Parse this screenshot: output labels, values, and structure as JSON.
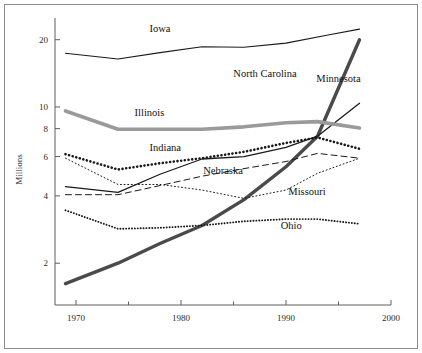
{
  "chart_data": {
    "type": "line",
    "title": "",
    "subtitle": "",
    "xlabel": "",
    "ylabel": "Millions",
    "yscale": "log",
    "xlim": [
      1968,
      2000
    ],
    "ylim": [
      1.3,
      24
    ],
    "grid": false,
    "legend_position": "inline-labels",
    "x_ticks": [
      1970,
      1980,
      1990,
      2000
    ],
    "x_tick_labels": [
      "1970",
      "1980",
      "1990",
      "2000"
    ],
    "x_minor_ticks": [
      1975,
      1985,
      1995
    ],
    "y_ticks": [
      2,
      4,
      6,
      8,
      10,
      20
    ],
    "y_tick_labels": [
      "2",
      "4",
      "6",
      "8",
      "10",
      "20"
    ],
    "series": [
      {
        "name": "Iowa",
        "label": "Iowa",
        "color": "#1a1a1a",
        "style": "solid-thin",
        "stroke_width": 1.1,
        "dasharray": "none",
        "label_x": 1978.0,
        "label_y": 21.6,
        "x": [
          1969,
          1974,
          1978,
          1982,
          1986,
          1990,
          1994,
          1997
        ],
        "y": [
          17.4,
          16.4,
          17.5,
          18.6,
          18.5,
          19.3,
          21.0,
          22.3
        ]
      },
      {
        "name": "North Carolina",
        "label": "North Carolina",
        "color": "#4a4a4a",
        "style": "solid-thick",
        "stroke_width": 3.4,
        "dasharray": "none",
        "label_x": 1988.0,
        "label_y": 13.6,
        "x": [
          1969,
          1974,
          1978,
          1982,
          1986,
          1990,
          1993,
          1997
        ],
        "y": [
          1.62,
          2.0,
          2.45,
          2.95,
          3.85,
          5.4,
          7.4,
          20.0
        ]
      },
      {
        "name": "Minnesota",
        "label": "Minnesota",
        "color": "#1a1a1a",
        "style": "solid-thin",
        "stroke_width": 1.3,
        "dasharray": "none",
        "label_x": 1995.0,
        "label_y": 12.9,
        "x": [
          1969,
          1974,
          1978,
          1982,
          1986,
          1990,
          1993,
          1997
        ],
        "y": [
          4.4,
          4.15,
          5.0,
          5.85,
          6.0,
          6.6,
          7.4,
          10.4
        ]
      },
      {
        "name": "Illinois",
        "label": "Illinois",
        "color": "#9a9a9a",
        "style": "solid-thick",
        "stroke_width": 3.6,
        "dasharray": "none",
        "label_x": 1977.0,
        "label_y": 9.1,
        "x": [
          1969,
          1974,
          1978,
          1982,
          1986,
          1990,
          1993,
          1997
        ],
        "y": [
          9.6,
          7.95,
          7.95,
          7.95,
          8.15,
          8.5,
          8.6,
          8.05
        ]
      },
      {
        "name": "Indiana",
        "label": "Indiana",
        "color": "#1a1a1a",
        "style": "dotted-thick",
        "stroke_width": 2.6,
        "dasharray": "0.1 3.6",
        "label_x": 1978.5,
        "label_y": 6.35,
        "x": [
          1969,
          1974,
          1978,
          1982,
          1986,
          1990,
          1993,
          1997
        ],
        "y": [
          6.15,
          5.25,
          5.6,
          5.9,
          6.3,
          6.9,
          7.3,
          6.5
        ]
      },
      {
        "name": "Nebraska",
        "label": "Nebraska",
        "color": "#1a1a1a",
        "style": "dashed",
        "stroke_width": 1.0,
        "dasharray": "6 4",
        "label_x": 1984.0,
        "label_y": 5.0,
        "x": [
          1969,
          1974,
          1978,
          1982,
          1986,
          1990,
          1993,
          1997
        ],
        "y": [
          4.05,
          4.05,
          4.45,
          4.9,
          5.3,
          5.7,
          6.2,
          5.9
        ]
      },
      {
        "name": "Missouri",
        "label": "Missouri",
        "color": "#1a1a1a",
        "style": "dotted-fine",
        "stroke_width": 1.0,
        "dasharray": "1 2.6",
        "label_x": 1992.0,
        "label_y": 4.05,
        "x": [
          1969,
          1974,
          1978,
          1982,
          1986,
          1990,
          1993,
          1997
        ],
        "y": [
          5.9,
          4.5,
          4.5,
          4.25,
          3.9,
          4.25,
          5.05,
          5.9
        ]
      },
      {
        "name": "Ohio",
        "label": "Ohio",
        "color": "#1a1a1a",
        "style": "dotted-medium",
        "stroke_width": 1.9,
        "dasharray": "0.1 2.8",
        "label_x": 1990.5,
        "label_y": 2.85,
        "x": [
          1969,
          1974,
          1978,
          1982,
          1986,
          1990,
          1993,
          1997
        ],
        "y": [
          3.45,
          2.85,
          2.88,
          2.95,
          3.08,
          3.15,
          3.15,
          3.0
        ]
      }
    ]
  }
}
